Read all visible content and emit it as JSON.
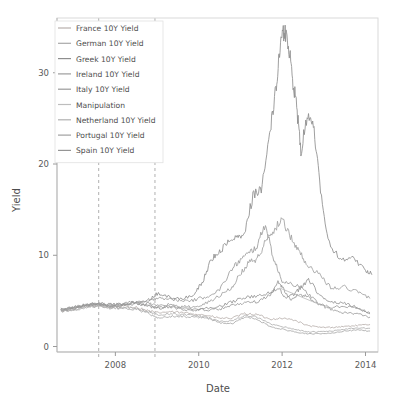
{
  "chart_data": {
    "type": "line",
    "title": "",
    "xlabel": "Date",
    "ylabel": "Yield",
    "xlim": [
      2006.6,
      2014.3
    ],
    "ylim": [
      -0.6,
      36.0
    ],
    "xticks": [
      2008,
      2010,
      2012,
      2014
    ],
    "xtick_labels": [
      "2008",
      "2010",
      "2012",
      "2014"
    ],
    "yticks": [
      0,
      10,
      20,
      30
    ],
    "ytick_labels": [
      "0",
      "10",
      "20",
      "30"
    ],
    "grid": false,
    "legend_position": "top-left",
    "annotations": [
      {
        "name": "event-line-1",
        "type": "vline",
        "x": 2007.6,
        "style": "dashed"
      },
      {
        "name": "event-line-2",
        "type": "vline",
        "x": 2008.95,
        "style": "dashed"
      }
    ],
    "series": [
      {
        "name": "France 10Y Yield",
        "color": "#b8b0ac",
        "x": [
          2006.7,
          2007.0,
          2007.3,
          2007.6,
          2007.9,
          2008.2,
          2008.5,
          2008.8,
          2009.0,
          2009.3,
          2009.6,
          2009.9,
          2010.2,
          2010.5,
          2010.8,
          2011.1,
          2011.4,
          2011.7,
          2012.0,
          2012.3,
          2012.6,
          2012.9,
          2013.2,
          2013.5,
          2013.8,
          2014.1
        ],
        "values": [
          3.9,
          4.1,
          4.4,
          4.5,
          4.3,
          4.4,
          4.3,
          3.9,
          3.7,
          3.8,
          3.7,
          3.6,
          3.4,
          3.1,
          3.1,
          3.6,
          3.5,
          3.0,
          3.1,
          2.9,
          2.3,
          2.1,
          2.1,
          2.2,
          2.3,
          2.4
        ]
      },
      {
        "name": "German 10Y Yield",
        "color": "#a9a9a9",
        "x": [
          2006.7,
          2007.0,
          2007.3,
          2007.6,
          2007.9,
          2008.2,
          2008.5,
          2008.8,
          2009.0,
          2009.3,
          2009.6,
          2009.9,
          2010.2,
          2010.5,
          2010.8,
          2011.1,
          2011.4,
          2011.7,
          2012.0,
          2012.3,
          2012.6,
          2012.9,
          2013.2,
          2013.5,
          2013.8,
          2014.1
        ],
        "values": [
          3.8,
          4.0,
          4.3,
          4.4,
          4.2,
          4.2,
          4.1,
          3.6,
          3.2,
          3.3,
          3.3,
          3.2,
          3.1,
          2.6,
          2.5,
          3.2,
          3.0,
          2.2,
          1.9,
          1.6,
          1.4,
          1.4,
          1.5,
          1.7,
          1.8,
          1.7
        ]
      },
      {
        "name": "Greek 10Y Yield",
        "color": "#8e8e8e",
        "x": [
          2006.7,
          2007.0,
          2007.3,
          2007.6,
          2007.9,
          2008.2,
          2008.5,
          2008.8,
          2009.0,
          2009.3,
          2009.6,
          2009.9,
          2010.1,
          2010.3,
          2010.5,
          2010.7,
          2010.9,
          2011.1,
          2011.3,
          2011.5,
          2011.7,
          2011.85,
          2011.95,
          2012.05,
          2012.15,
          2012.25,
          2012.35,
          2012.45,
          2012.6,
          2012.75,
          2012.9,
          2013.1,
          2013.4,
          2013.7,
          2014.0,
          2014.15
        ],
        "values": [
          4.1,
          4.3,
          4.6,
          4.7,
          4.6,
          4.7,
          4.9,
          5.1,
          5.8,
          5.4,
          5.2,
          5.8,
          7.2,
          9.5,
          10.5,
          11.3,
          11.9,
          12.5,
          16.5,
          17.2,
          23.0,
          28.5,
          33.0,
          34.6,
          33.2,
          29.5,
          26.5,
          21.0,
          25.5,
          24.0,
          18.0,
          11.5,
          9.5,
          9.8,
          8.3,
          7.9
        ]
      },
      {
        "name": "Ireland 10Y Yield",
        "color": "#9c9c9c",
        "x": [
          2006.7,
          2007.0,
          2007.3,
          2007.6,
          2007.9,
          2008.2,
          2008.5,
          2008.8,
          2009.0,
          2009.3,
          2009.6,
          2009.9,
          2010.2,
          2010.5,
          2010.8,
          2011.0,
          2011.2,
          2011.4,
          2011.6,
          2011.8,
          2012.0,
          2012.3,
          2012.6,
          2012.9,
          2013.2,
          2013.5,
          2013.8,
          2014.1
        ],
        "values": [
          3.9,
          4.2,
          4.5,
          4.6,
          4.5,
          4.7,
          4.8,
          4.9,
          5.4,
          5.2,
          5.0,
          5.1,
          5.5,
          6.2,
          8.5,
          9.5,
          10.2,
          11.0,
          13.5,
          9.5,
          7.2,
          6.8,
          5.9,
          4.6,
          4.0,
          3.7,
          3.6,
          3.2
        ]
      },
      {
        "name": "Italy 10Y Yield",
        "color": "#9a9a9a",
        "x": [
          2006.7,
          2007.0,
          2007.3,
          2007.6,
          2007.9,
          2008.2,
          2008.5,
          2008.8,
          2009.0,
          2009.3,
          2009.6,
          2009.9,
          2010.2,
          2010.5,
          2010.8,
          2011.1,
          2011.4,
          2011.7,
          2011.9,
          2012.0,
          2012.2,
          2012.4,
          2012.6,
          2012.9,
          2013.2,
          2013.5,
          2013.8,
          2014.1
        ],
        "values": [
          4.0,
          4.3,
          4.6,
          4.7,
          4.5,
          4.6,
          4.8,
          4.5,
          4.3,
          4.4,
          4.2,
          4.1,
          4.0,
          4.1,
          4.5,
          4.8,
          4.9,
          5.6,
          7.0,
          6.5,
          5.1,
          5.7,
          5.5,
          4.6,
          4.3,
          4.4,
          4.2,
          3.7
        ]
      },
      {
        "name": "Manipulation",
        "color": "#bdbdbd",
        "x": [
          2011.95,
          2012.9
        ],
        "values": [
          6.4,
          4.6
        ]
      },
      {
        "name": "Netherland 10Y Yield",
        "color": "#b0b0b0",
        "x": [
          2006.7,
          2007.0,
          2007.3,
          2007.6,
          2007.9,
          2008.2,
          2008.5,
          2008.8,
          2009.0,
          2009.3,
          2009.6,
          2009.9,
          2010.2,
          2010.5,
          2010.8,
          2011.1,
          2011.4,
          2011.7,
          2012.0,
          2012.3,
          2012.6,
          2012.9,
          2013.2,
          2013.5,
          2013.8,
          2014.1
        ],
        "values": [
          3.85,
          4.05,
          4.35,
          4.45,
          4.25,
          4.3,
          4.2,
          3.8,
          3.5,
          3.6,
          3.5,
          3.4,
          3.2,
          2.8,
          2.8,
          3.4,
          3.2,
          2.5,
          2.2,
          1.9,
          1.6,
          1.6,
          1.7,
          1.9,
          2.0,
          2.0
        ]
      },
      {
        "name": "Portugal 10Y Yield",
        "color": "#a0a0a0",
        "x": [
          2006.7,
          2007.0,
          2007.3,
          2007.6,
          2007.9,
          2008.2,
          2008.5,
          2008.8,
          2009.0,
          2009.3,
          2009.6,
          2009.9,
          2010.2,
          2010.5,
          2010.8,
          2011.0,
          2011.2,
          2011.4,
          2011.6,
          2011.8,
          2012.0,
          2012.2,
          2012.4,
          2012.6,
          2012.9,
          2013.2,
          2013.5,
          2013.8,
          2014.1
        ],
        "values": [
          4.0,
          4.25,
          4.55,
          4.65,
          4.5,
          4.6,
          4.8,
          4.7,
          4.5,
          4.6,
          4.4,
          4.3,
          4.8,
          5.6,
          6.5,
          8.0,
          9.2,
          9.6,
          11.5,
          12.8,
          14.0,
          12.0,
          10.5,
          9.0,
          7.8,
          6.3,
          6.5,
          6.0,
          5.3
        ]
      },
      {
        "name": "Spain 10Y Yield",
        "color": "#959595",
        "x": [
          2006.7,
          2007.0,
          2007.3,
          2007.6,
          2007.9,
          2008.2,
          2008.5,
          2008.8,
          2009.0,
          2009.3,
          2009.6,
          2009.9,
          2010.2,
          2010.5,
          2010.8,
          2011.1,
          2011.4,
          2011.7,
          2011.9,
          2012.1,
          2012.3,
          2012.5,
          2012.65,
          2012.9,
          2013.2,
          2013.5,
          2013.8,
          2014.1
        ],
        "values": [
          3.95,
          4.2,
          4.5,
          4.6,
          4.4,
          4.5,
          4.7,
          4.4,
          4.2,
          4.3,
          4.1,
          4.0,
          4.2,
          4.4,
          4.9,
          5.4,
          5.5,
          5.9,
          6.4,
          5.3,
          5.8,
          6.7,
          7.3,
          5.6,
          4.9,
          4.7,
          4.3,
          3.6
        ]
      }
    ]
  },
  "legend": {
    "items": [
      {
        "label": "France 10Y Yield",
        "color": "#b8b0ac"
      },
      {
        "label": "German 10Y Yield",
        "color": "#a9a9a9"
      },
      {
        "label": "Greek 10Y Yield",
        "color": "#8e8e8e"
      },
      {
        "label": "Ireland 10Y Yield",
        "color": "#9c9c9c"
      },
      {
        "label": "Italy 10Y Yield",
        "color": "#9a9a9a"
      },
      {
        "label": "Manipulation",
        "color": "#bdbdbd"
      },
      {
        "label": "Netherland 10Y Yield",
        "color": "#b0b0b0"
      },
      {
        "label": "Portugal 10Y Yield",
        "color": "#a0a0a0"
      },
      {
        "label": "Spain 10Y Yield",
        "color": "#959595"
      }
    ]
  }
}
